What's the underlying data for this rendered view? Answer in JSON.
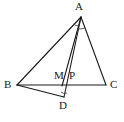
{
  "figure": {
    "kind": "geometry-diagram",
    "width": 124,
    "height": 122,
    "background_color": "#ffffff",
    "stroke_color": "#1a1a1a",
    "label_color": "#1a1a1a"
  },
  "points": {
    "A": {
      "label": "A",
      "x": 81,
      "y": 17,
      "label_x": 75,
      "label_y": 1
    },
    "B": {
      "label": "B",
      "x": 17,
      "y": 85,
      "label_x": 4,
      "label_y": 80
    },
    "C": {
      "label": "C",
      "x": 106,
      "y": 85,
      "label_x": 110,
      "label_y": 80
    },
    "D": {
      "label": "D",
      "x": 64,
      "y": 97,
      "label_x": 60,
      "label_y": 100
    },
    "M": {
      "label": "M",
      "x": 62,
      "y": 85,
      "label_x": 55,
      "label_y": 71
    },
    "P": {
      "label": "P",
      "x": 70,
      "y": 85,
      "label_x": 70,
      "label_y": 71
    }
  },
  "segments": [
    {
      "name": "AB",
      "from": "A",
      "to": "B"
    },
    {
      "name": "AC",
      "from": "A",
      "to": "C"
    },
    {
      "name": "AD",
      "from": "A",
      "to": "D"
    },
    {
      "name": "AM",
      "from": "A",
      "to": "M"
    },
    {
      "name": "BC",
      "from": "B",
      "to": "C"
    },
    {
      "name": "BD",
      "from": "B",
      "to": "D"
    }
  ],
  "angle_marks": [
    {
      "name": "angle-at-A-left",
      "vertex": "A",
      "radius": 9
    },
    {
      "name": "angle-at-A-right",
      "vertex": "A",
      "radius": 12
    },
    {
      "name": "angle-at-D",
      "vertex": "D",
      "radius": 6
    }
  ],
  "labels": {
    "A": "A",
    "B": "B",
    "C": "C",
    "D": "D",
    "M": "M",
    "P": "P"
  }
}
